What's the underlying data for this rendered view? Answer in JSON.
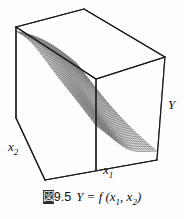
{
  "figure": {
    "caption_prefix_kanji": "図",
    "caption_number": "9.5",
    "caption_expression_main": "Y = f (x",
    "caption_sub_1": "1",
    "caption_expression_mid": ",  x",
    "caption_sub_2": "2",
    "caption_expression_end": ")",
    "caption_full": "図9.5  Y = f (x1,  x2)",
    "background_color": "#fdfdfd",
    "line_color": "#1a1a1a",
    "mesh_color": "#3a3a3a"
  },
  "axes": {
    "x1": {
      "label": "x",
      "subscript": "1"
    },
    "x2": {
      "label": "x",
      "subscript": "2"
    },
    "y": {
      "label": "Y",
      "subscript": ""
    }
  },
  "chart_data": {
    "type": "surface",
    "xlabel": "x1",
    "ylabel": "x2",
    "zlabel": "Y",
    "grid": true,
    "legend": "none",
    "projection": "3d-wireframe-box",
    "x": [
      0.0,
      0.1,
      0.2,
      0.3,
      0.4,
      0.5,
      0.6,
      0.7,
      0.8,
      0.9,
      1.0
    ],
    "y": [
      0.0,
      0.1,
      0.2,
      0.3,
      0.4,
      0.5,
      0.6,
      0.7,
      0.8,
      0.9,
      1.0
    ],
    "z": [
      [
        1.0,
        0.99,
        0.98,
        0.96,
        0.92,
        0.86,
        0.76,
        0.62,
        0.46,
        0.31,
        0.2
      ],
      [
        0.99,
        0.98,
        0.96,
        0.93,
        0.89,
        0.82,
        0.71,
        0.57,
        0.42,
        0.28,
        0.18
      ],
      [
        0.97,
        0.96,
        0.94,
        0.9,
        0.85,
        0.77,
        0.66,
        0.52,
        0.37,
        0.24,
        0.15
      ],
      [
        0.95,
        0.93,
        0.9,
        0.86,
        0.8,
        0.71,
        0.6,
        0.46,
        0.32,
        0.2,
        0.12
      ],
      [
        0.91,
        0.89,
        0.86,
        0.81,
        0.74,
        0.65,
        0.53,
        0.4,
        0.27,
        0.17,
        0.1
      ],
      [
        0.86,
        0.84,
        0.8,
        0.74,
        0.67,
        0.57,
        0.46,
        0.34,
        0.22,
        0.13,
        0.08
      ],
      [
        0.79,
        0.76,
        0.72,
        0.66,
        0.58,
        0.49,
        0.38,
        0.27,
        0.17,
        0.1,
        0.06
      ],
      [
        0.7,
        0.67,
        0.62,
        0.56,
        0.48,
        0.39,
        0.3,
        0.21,
        0.13,
        0.07,
        0.04
      ],
      [
        0.59,
        0.56,
        0.51,
        0.45,
        0.38,
        0.3,
        0.22,
        0.15,
        0.09,
        0.05,
        0.03
      ],
      [
        0.47,
        0.44,
        0.4,
        0.34,
        0.28,
        0.22,
        0.16,
        0.1,
        0.06,
        0.03,
        0.02
      ],
      [
        0.36,
        0.33,
        0.29,
        0.25,
        0.2,
        0.15,
        0.11,
        0.07,
        0.04,
        0.02,
        0.01
      ]
    ],
    "xlim": [
      0,
      1
    ],
    "ylim": [
      0,
      1
    ],
    "zlim": [
      0,
      1
    ]
  }
}
